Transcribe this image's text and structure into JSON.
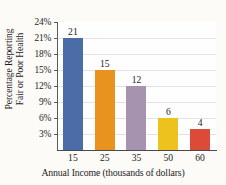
{
  "chart_data": {
    "type": "bar",
    "title": "",
    "xlabel": "Annual Income (thousands of dollars)",
    "ylabel_line1": "Percentage Reporting",
    "ylabel_line2": "Fair or Poor Health",
    "categories": [
      "15",
      "25",
      "35",
      "50",
      "60"
    ],
    "values": [
      21,
      15,
      12,
      6,
      4
    ],
    "value_labels": [
      "21",
      "15",
      "12",
      "6",
      "4"
    ],
    "ylim": [
      0,
      24
    ],
    "ytick_values": [
      24,
      21,
      18,
      15,
      12,
      9,
      6,
      3
    ],
    "ytick_labels": [
      "24%",
      "21%",
      "18%",
      "15%",
      "12%",
      "9%",
      "6%",
      "3%"
    ],
    "grid": true,
    "legend": "none",
    "bar_colors": [
      "#4a6da7",
      "#e8921f",
      "#a593b0",
      "#edc21e",
      "#dc4b3a"
    ]
  },
  "colors": {
    "background": "#fcfbf8",
    "plot_background": "#fefefe",
    "gridline": "#e3e3e3",
    "axis": "#4a4a4a",
    "text": "#1d1d1d"
  }
}
